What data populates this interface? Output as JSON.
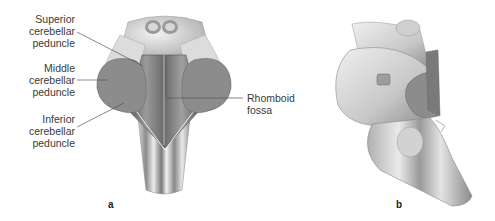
{
  "figure": {
    "panels": [
      {
        "id": "a",
        "letter": "a",
        "view": "dorsal view of brainstem",
        "labels": [
          {
            "line1": "Superior",
            "line2": "cerebellar",
            "line3": "peduncle"
          },
          {
            "line1": "Middle",
            "line2": "cerebellar",
            "line3": "peduncle"
          },
          {
            "line1": "Inferior",
            "line2": "cerebellar",
            "line3": "peduncle"
          },
          {
            "line1": "Rhomboid",
            "line2": "fossa"
          }
        ]
      },
      {
        "id": "b",
        "letter": "b",
        "view": "lateral view of brainstem"
      }
    ],
    "colors": {
      "cut_surface": "#8c8c8c",
      "tissue_light": "#e6e6e6",
      "tissue_mid": "#b5b5b5",
      "tissue_dark": "#6e6e6e",
      "leader_line": "#555555",
      "text": "#3a3a3a"
    }
  }
}
